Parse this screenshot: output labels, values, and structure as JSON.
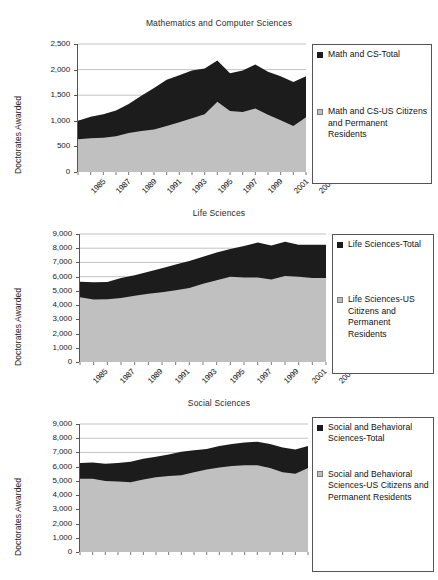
{
  "page": {
    "background": "#ffffff",
    "series_colors": {
      "total": "#1c1c1c",
      "us_citizens": "#c0c0c0",
      "axis": "#555555",
      "gridline": "#a9a9a9"
    }
  },
  "charts": [
    {
      "id": "mathematics-and-computer-sciences",
      "title": "Mathematics and Computer Sciences",
      "ylabel": "Doctorates Awarded",
      "yticks": [
        "2,500",
        "2,000",
        "1,500",
        "1,000",
        "500",
        "0"
      ],
      "xticks": [
        "1985",
        "1987",
        "1989",
        "1991",
        "1993",
        "1995",
        "1997",
        "1999",
        "2001",
        "2003"
      ],
      "legend": [
        {
          "marker": "black",
          "label": "Math and CS-Total"
        },
        {
          "marker": "gray",
          "label": "Math and CS-US Citizens and Permanent Residents"
        }
      ]
    },
    {
      "id": "life-sciences",
      "title": "Life Sciences",
      "ylabel": "Doctorates Awarded",
      "yticks": [
        "9,000",
        "8,000",
        "7,000",
        "6,000",
        "5,000",
        "4,000",
        "3,000",
        "2,000",
        "1,000",
        "0"
      ],
      "xticks": [
        "1985",
        "1987",
        "1989",
        "1991",
        "1993",
        "1995",
        "1997",
        "1999",
        "2001",
        "2003"
      ],
      "legend": [
        {
          "marker": "black",
          "label": "Life Sciences-Total"
        },
        {
          "marker": "gray",
          "label": "Life Sciences-US Citizens and Permanent Residents"
        }
      ]
    },
    {
      "id": "social-sciences",
      "title": "Social Sciences",
      "ylabel": "Doctorates Awarded",
      "yticks": [
        "9,000",
        "8,000",
        "7,000",
        "6,000",
        "5,000",
        "4,000",
        "3,000",
        "2,000",
        "1,000",
        "0"
      ],
      "xticks": [],
      "legend": [
        {
          "marker": "black",
          "label": "Social and Behavioral Sciences-Total"
        },
        {
          "marker": "gray",
          "label": "Social and Behavioral Sciences-US Citizens and Permanent Residents"
        }
      ]
    }
  ],
  "chart_data": [
    {
      "type": "area",
      "stacked": false,
      "title": "Mathematics and Computer Sciences",
      "xlabel": "",
      "ylabel": "Doctorates Awarded",
      "ylim": [
        0,
        2500
      ],
      "xlim": [
        1985,
        2003
      ],
      "grid": true,
      "legend_position": "right",
      "x": [
        1985,
        1986,
        1987,
        1988,
        1989,
        1990,
        1991,
        1992,
        1993,
        1994,
        1995,
        1996,
        1997,
        1998,
        1999,
        2000,
        2001,
        2002,
        2003
      ],
      "series": [
        {
          "name": "Math and CS-Total",
          "color": "#1c1c1c",
          "values": [
            1000,
            1080,
            1130,
            1200,
            1330,
            1490,
            1640,
            1800,
            1890,
            1980,
            2020,
            2180,
            1930,
            1980,
            2100,
            1960,
            1870,
            1760,
            1870
          ]
        },
        {
          "name": "Math and CS-US Citizens and Permanent Residents",
          "color": "#c0c0c0",
          "values": [
            640,
            660,
            670,
            700,
            760,
            800,
            830,
            900,
            970,
            1050,
            1130,
            1370,
            1190,
            1170,
            1240,
            1120,
            1010,
            900,
            1070
          ]
        }
      ]
    },
    {
      "type": "area",
      "stacked": false,
      "title": "Life Sciences",
      "xlabel": "",
      "ylabel": "Doctorates Awarded",
      "ylim": [
        0,
        9000
      ],
      "xlim": [
        1985,
        2003
      ],
      "grid": true,
      "legend_position": "right",
      "x": [
        1985,
        1986,
        1987,
        1988,
        1989,
        1990,
        1991,
        1992,
        1993,
        1994,
        1995,
        1996,
        1997,
        1998,
        1999,
        2000,
        2001,
        2002,
        2003
      ],
      "series": [
        {
          "name": "Life Sciences-Total",
          "color": "#1c1c1c",
          "values": [
            5650,
            5600,
            5620,
            5900,
            6100,
            6350,
            6600,
            6850,
            7100,
            7400,
            7700,
            7950,
            8150,
            8400,
            8200,
            8450,
            8250,
            8250,
            8250
          ]
        },
        {
          "name": "Life Sciences-US Citizens and Permanent Residents",
          "color": "#c0c0c0",
          "values": [
            4550,
            4400,
            4420,
            4500,
            4650,
            4800,
            4900,
            5050,
            5200,
            5500,
            5750,
            6000,
            5950,
            5950,
            5800,
            6050,
            6000,
            5900,
            5900
          ]
        }
      ]
    },
    {
      "type": "area",
      "stacked": false,
      "title": "Social Sciences",
      "xlabel": "",
      "ylabel": "Doctorates Awarded",
      "ylim": [
        0,
        9000
      ],
      "xlim": [
        1985,
        2003
      ],
      "grid": true,
      "legend_position": "right",
      "x": [
        1985,
        1986,
        1987,
        1988,
        1989,
        1990,
        1991,
        1992,
        1993,
        1994,
        1995,
        1996,
        1997,
        1998,
        1999,
        2000,
        2001,
        2002,
        2003
      ],
      "series": [
        {
          "name": "Social and Behavioral Sciences-Total",
          "color": "#1c1c1c",
          "values": [
            6250,
            6300,
            6200,
            6250,
            6350,
            6550,
            6700,
            6850,
            7050,
            7150,
            7250,
            7450,
            7600,
            7700,
            7750,
            7600,
            7350,
            7200,
            7450
          ]
        },
        {
          "name": "Social and Behavioral Sciences-US Citizens and Permanent Residents",
          "color": "#c0c0c0",
          "values": [
            5150,
            5150,
            5000,
            4950,
            4900,
            5100,
            5250,
            5350,
            5400,
            5600,
            5800,
            5950,
            6050,
            6100,
            6100,
            5900,
            5600,
            5500,
            5900
          ]
        }
      ]
    }
  ]
}
